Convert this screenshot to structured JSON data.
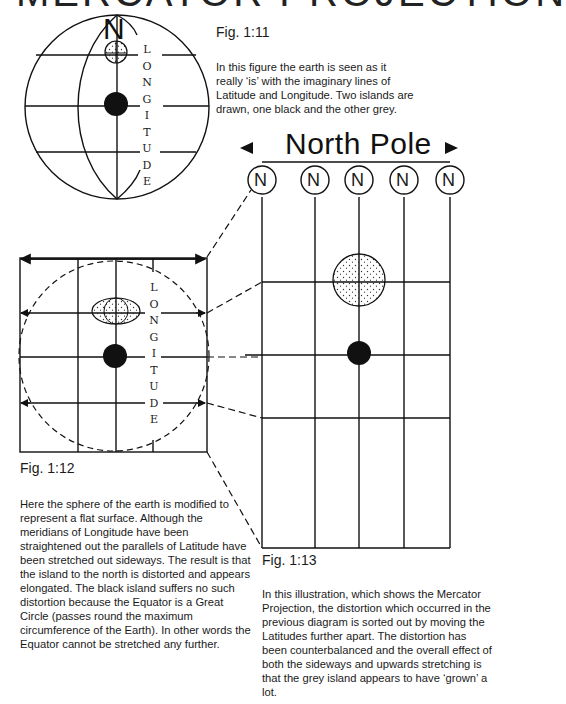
{
  "title": "MERCATOR PROJECTION",
  "fig11": {
    "label": "Fig. 1:11",
    "caption": "In this figure the earth is seen as it really ‘is’ with the imaginary lines of Latitude and Longitude. Two islands are drawn, one black and the other grey.",
    "north_label": "N",
    "longitude_letters": [
      "L",
      "O",
      "N",
      "G",
      "I",
      "T",
      "U",
      "D",
      "E"
    ]
  },
  "fig12": {
    "label": "Fig. 1:12",
    "caption": "Here the sphere of the earth is modified to represent a flat surface. Although the meridians of Longitude have been straightened out the parallels of Latitude have been stretched out sideways. The result is that the island to the north is distorted and appears elongated. The black island suffers no such distortion because the Equator is a Great Circle (passes round the maximum circumference of the Earth). In other words the Equator cannot be stretched any further.",
    "longitude_letters": [
      "L",
      "O",
      "N",
      "G",
      "I",
      "T",
      "U",
      "D",
      "E"
    ]
  },
  "fig13": {
    "label": "Fig. 1:13",
    "north_pole_label": "North Pole",
    "pole_markers": [
      "N",
      "N",
      "N",
      "N",
      "N"
    ],
    "caption": "In this illustration, which shows the Mercator Projection, the distortion which occurred in the previous diagram is sorted out by moving the Latitudes further apart. The distortion has been counterbalanced and the overall effect of both the sideways and upwards stretching is that the grey island appears to have ‘grown’ a lot."
  },
  "colors": {
    "ink": "#111111",
    "background": "#ffffff",
    "grey_island_dots": "#333333"
  }
}
